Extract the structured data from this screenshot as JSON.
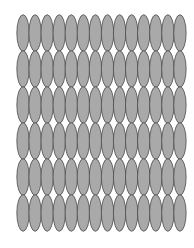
{
  "figure": {
    "rows": 6,
    "columns": 14,
    "shape": "ellipse",
    "colors": {
      "fill": "#a9a9a9",
      "stroke": "#4a4a4a",
      "background": "#ffffff"
    },
    "layout": {
      "origin_x": 17,
      "origin_y": 15,
      "cell_width": 12.07,
      "cell_height": 36,
      "ellipse_rx": 6.2,
      "ellipse_ry": 18.3
    }
  }
}
